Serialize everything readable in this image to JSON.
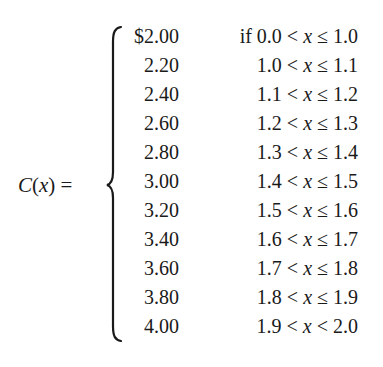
{
  "equation": {
    "lhs": {
      "function_name": "C",
      "open_paren": "(",
      "variable": "x",
      "close_paren": ")",
      "equals": "="
    },
    "variable": "x",
    "cases": [
      {
        "value": "$2.00",
        "prefix": "if ",
        "lower": "0.0",
        "op1": "<",
        "op2": "≤",
        "upper": "1.0"
      },
      {
        "value": "2.20",
        "prefix": "",
        "lower": "1.0",
        "op1": "<",
        "op2": "≤",
        "upper": "1.1"
      },
      {
        "value": "2.40",
        "prefix": "",
        "lower": "1.1",
        "op1": "<",
        "op2": "≤",
        "upper": "1.2"
      },
      {
        "value": "2.60",
        "prefix": "",
        "lower": "1.2",
        "op1": "<",
        "op2": "≤",
        "upper": "1.3"
      },
      {
        "value": "2.80",
        "prefix": "",
        "lower": "1.3",
        "op1": "<",
        "op2": "≤",
        "upper": "1.4"
      },
      {
        "value": "3.00",
        "prefix": "",
        "lower": "1.4",
        "op1": "<",
        "op2": "≤",
        "upper": "1.5"
      },
      {
        "value": "3.20",
        "prefix": "",
        "lower": "1.5",
        "op1": "<",
        "op2": "≤",
        "upper": "1.6"
      },
      {
        "value": "3.40",
        "prefix": "",
        "lower": "1.6",
        "op1": "<",
        "op2": "≤",
        "upper": "1.7"
      },
      {
        "value": "3.60",
        "prefix": "",
        "lower": "1.7",
        "op1": "<",
        "op2": "≤",
        "upper": "1.8"
      },
      {
        "value": "3.80",
        "prefix": "",
        "lower": "1.8",
        "op1": "<",
        "op2": "≤",
        "upper": "1.9"
      },
      {
        "value": "4.00",
        "prefix": "",
        "lower": "1.9",
        "op1": "<",
        "op2": "<",
        "upper": "2.0"
      }
    ]
  }
}
